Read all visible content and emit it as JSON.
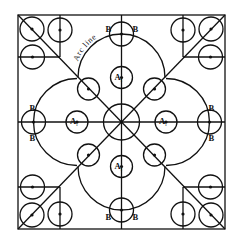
{
  "diagram": {
    "title": "",
    "labels": {
      "arc_line": "Arc line",
      "a": "A",
      "a_subscript": "1",
      "b": "B"
    },
    "components": {
      "outer_square": "square frame",
      "central_circle": "center circle with 8 radial lines",
      "lobes": [
        "top",
        "right",
        "bottom",
        "left"
      ],
      "a_circles": [
        "top",
        "right",
        "bottom",
        "left"
      ],
      "b_circles": [
        "top",
        "right",
        "bottom",
        "left"
      ],
      "diagonal_circles": [
        "upper-left",
        "upper-right",
        "lower-right",
        "lower-left"
      ],
      "corner_groups": [
        "top-left",
        "top-right",
        "bottom-right",
        "bottom-left"
      ]
    }
  }
}
